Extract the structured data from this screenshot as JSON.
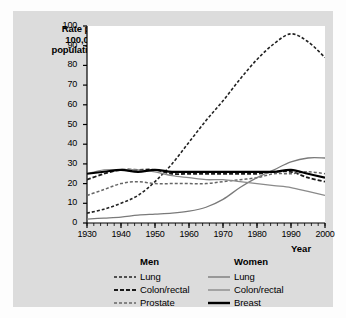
{
  "figure": {
    "panel_bg": "#dcdcdc",
    "plot_bg": "#ffffff",
    "axis_color": "#000000"
  },
  "axes": {
    "y_axis_label_line1": "Rate per",
    "y_axis_label_line2": "100,000",
    "y_axis_label_line3": "population",
    "x_axis_title": "Year",
    "y_ticks": [
      "100",
      "90",
      "80",
      "70",
      "60",
      "50",
      "40",
      "30",
      "20",
      "10",
      "0"
    ],
    "x_ticks": [
      "1930",
      "1940",
      "1950",
      "1960",
      "1970",
      "1980",
      "1990",
      "2000"
    ]
  },
  "legend": {
    "men_header": "Men",
    "women_header": "Women",
    "men_items": [
      {
        "label": "Lung",
        "style": "dash-dot-men-lung",
        "color": "#222222"
      },
      {
        "label": "Colon/rectal",
        "style": "dash-men-colon",
        "color": "#1a1a1a"
      },
      {
        "label": "Prostate",
        "style": "dash-men-prostate",
        "color": "#666666"
      }
    ],
    "women_items": [
      {
        "label": "Lung",
        "style": "solid-thin",
        "color": "#7a7a7a"
      },
      {
        "label": "Colon/rectal",
        "style": "solid-thin",
        "color": "#8a8a8a"
      },
      {
        "label": "Breast",
        "style": "solid-thick",
        "color": "#000000"
      }
    ]
  },
  "chart_data": {
    "type": "line",
    "title": "",
    "xlabel": "Year",
    "ylabel": "Rate per 100,000 population",
    "xlim": [
      1930,
      2000
    ],
    "ylim": [
      0,
      100
    ],
    "y_tick_step": 10,
    "x_tick_step": 10,
    "x_minor_tick_step": 2,
    "grid": false,
    "legend_position": "below",
    "x": [
      1930,
      1935,
      1940,
      1945,
      1950,
      1955,
      1960,
      1965,
      1970,
      1975,
      1980,
      1985,
      1990,
      1995,
      2000
    ],
    "series": [
      {
        "name": "Lung (Men)",
        "group": "Men",
        "color": "#222222",
        "style": "dashed",
        "width": 1.6,
        "values": [
          5,
          7,
          10,
          14,
          21,
          30,
          41,
          52,
          62,
          73,
          83,
          91,
          96,
          92,
          84
        ]
      },
      {
        "name": "Colon/rectal (Men)",
        "group": "Men",
        "color": "#1a1a1a",
        "style": "dashed",
        "width": 1.8,
        "values": [
          22,
          25,
          27,
          27,
          27,
          25,
          25,
          25,
          25,
          25,
          25,
          26,
          26,
          23,
          21
        ]
      },
      {
        "name": "Prostate (Men)",
        "group": "Men",
        "color": "#666666",
        "style": "dashed",
        "width": 1.5,
        "values": [
          14,
          17,
          20,
          21,
          20,
          20,
          20,
          20,
          21,
          22,
          23,
          25,
          25,
          26,
          25
        ]
      },
      {
        "name": "Lung (Women)",
        "group": "Women",
        "color": "#7a7a7a",
        "style": "solid",
        "width": 1.3,
        "values": [
          2,
          2.5,
          3,
          4,
          4.5,
          5,
          6,
          8,
          12,
          18,
          23,
          27,
          31,
          33,
          33
        ]
      },
      {
        "name": "Colon/rectal (Women)",
        "group": "Women",
        "color": "#8a8a8a",
        "style": "solid",
        "width": 1.3,
        "values": [
          25,
          27,
          27,
          27,
          26,
          24,
          23,
          22,
          22,
          21,
          20,
          19,
          18,
          16,
          14
        ]
      },
      {
        "name": "Breast (Women)",
        "group": "Women",
        "color": "#000000",
        "style": "solid",
        "width": 2.2,
        "values": [
          25,
          26,
          27,
          26,
          27,
          26,
          26,
          26,
          26,
          26,
          26,
          26,
          27,
          25,
          23
        ]
      }
    ]
  }
}
